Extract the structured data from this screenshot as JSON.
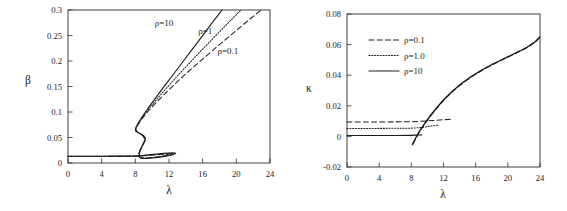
{
  "figure": {
    "title": "",
    "panel_count": 2
  },
  "chart_data": [
    {
      "type": "line",
      "panel": "left",
      "title": "",
      "xlabel": "λ",
      "ylabel": "β",
      "xlim": [
        0,
        24
      ],
      "ylim": [
        0,
        0.3
      ],
      "xticks": [
        0,
        4,
        8,
        12,
        16,
        20,
        24
      ],
      "xtick_labels": [
        "0",
        "4",
        "8",
        "12",
        "16",
        "20",
        "24"
      ],
      "yticks": [
        0,
        0.05,
        0.1,
        0.15,
        0.2,
        0.25,
        0.3
      ],
      "ytick_labels": [
        "0",
        "0.05",
        "0.1",
        "0.15",
        "0.2",
        "0.25",
        "0.3"
      ],
      "grid": false,
      "legend": "none",
      "annotations": [
        {
          "text": "ρ=10",
          "x": 11.4,
          "y": 0.268
        },
        {
          "text": "ρ=1",
          "x": 16.3,
          "y": 0.252
        },
        {
          "text": "ρ=0.1",
          "x": 19.0,
          "y": 0.214
        }
      ],
      "series": [
        {
          "name": "ρ=10",
          "style": "solid",
          "points": [
            [
              0.0,
              0.0132
            ],
            [
              2.0,
              0.0132
            ],
            [
              4.0,
              0.0133
            ],
            [
              6.0,
              0.0134
            ],
            [
              7.2,
              0.0136
            ],
            [
              8.2,
              0.0141
            ],
            [
              9.0,
              0.015
            ],
            [
              9.8,
              0.0163
            ],
            [
              10.6,
              0.0177
            ],
            [
              11.4,
              0.0189
            ],
            [
              12.0,
              0.0196
            ],
            [
              12.45,
              0.0199
            ],
            [
              12.7,
              0.0197
            ],
            [
              12.78,
              0.019
            ],
            [
              12.6,
              0.0172
            ],
            [
              12.1,
              0.0148
            ],
            [
              11.3,
              0.0124
            ],
            [
              10.4,
              0.0105
            ],
            [
              9.6,
              0.0094
            ],
            [
              9.05,
              0.0092
            ],
            [
              8.72,
              0.01
            ],
            [
              8.55,
              0.0118
            ],
            [
              8.48,
              0.0148
            ],
            [
              8.5,
              0.0196
            ],
            [
              8.62,
              0.0262
            ],
            [
              8.85,
              0.034
            ],
            [
              9.08,
              0.0408
            ],
            [
              9.2,
              0.0456
            ],
            [
              9.16,
              0.05
            ],
            [
              8.95,
              0.054
            ],
            [
              8.6,
              0.0575
            ],
            [
              8.25,
              0.0603
            ],
            [
              8.05,
              0.0626
            ],
            [
              8.0,
              0.0655
            ],
            [
              8.08,
              0.07
            ],
            [
              8.32,
              0.0775
            ],
            [
              8.7,
              0.0875
            ],
            [
              9.2,
              0.1
            ],
            [
              9.9,
              0.116
            ],
            [
              10.7,
              0.134
            ],
            [
              11.6,
              0.154
            ],
            [
              12.6,
              0.1755
            ],
            [
              13.6,
              0.1975
            ],
            [
              14.6,
              0.2195
            ],
            [
              15.5,
              0.239
            ],
            [
              16.4,
              0.259
            ],
            [
              17.2,
              0.2765
            ],
            [
              17.9,
              0.2915
            ],
            [
              18.3,
              0.3
            ]
          ]
        },
        {
          "name": "ρ=1",
          "style": "dotted",
          "points": [
            [
              0.0,
              0.013
            ],
            [
              2.0,
              0.013
            ],
            [
              4.0,
              0.0131
            ],
            [
              6.0,
              0.0132
            ],
            [
              7.4,
              0.0134
            ],
            [
              8.4,
              0.0139
            ],
            [
              9.2,
              0.0148
            ],
            [
              10.0,
              0.016
            ],
            [
              10.8,
              0.0172
            ],
            [
              11.5,
              0.0181
            ],
            [
              12.0,
              0.0186
            ],
            [
              12.3,
              0.0187
            ],
            [
              12.45,
              0.0184
            ],
            [
              12.4,
              0.0176
            ],
            [
              12.0,
              0.0158
            ],
            [
              11.3,
              0.0135
            ],
            [
              10.5,
              0.0114
            ],
            [
              9.7,
              0.01
            ],
            [
              9.1,
              0.0093
            ],
            [
              8.7,
              0.0095
            ],
            [
              8.5,
              0.0107
            ],
            [
              8.4,
              0.0132
            ],
            [
              8.4,
              0.0172
            ],
            [
              8.5,
              0.023
            ],
            [
              8.7,
              0.0305
            ],
            [
              8.95,
              0.0382
            ],
            [
              9.1,
              0.044
            ],
            [
              9.1,
              0.049
            ],
            [
              8.9,
              0.0535
            ],
            [
              8.6,
              0.057
            ],
            [
              8.3,
              0.06
            ],
            [
              8.1,
              0.0628
            ],
            [
              8.03,
              0.0658
            ],
            [
              8.12,
              0.0705
            ],
            [
              8.4,
              0.079
            ],
            [
              8.85,
              0.09
            ],
            [
              9.5,
              0.104
            ],
            [
              10.3,
              0.12
            ],
            [
              11.2,
              0.1375
            ],
            [
              12.2,
              0.156
            ],
            [
              13.3,
              0.176
            ],
            [
              14.4,
              0.1955
            ],
            [
              15.6,
              0.2165
            ],
            [
              16.8,
              0.237
            ],
            [
              18.0,
              0.2575
            ],
            [
              19.2,
              0.2775
            ],
            [
              20.3,
              0.296
            ],
            [
              20.55,
              0.3
            ]
          ]
        },
        {
          "name": "ρ=0.1",
          "style": "dashed",
          "points": [
            [
              0.0,
              0.0128
            ],
            [
              2.0,
              0.0128
            ],
            [
              4.0,
              0.0129
            ],
            [
              6.0,
              0.013
            ],
            [
              7.6,
              0.0133
            ],
            [
              8.6,
              0.0138
            ],
            [
              9.4,
              0.0146
            ],
            [
              10.2,
              0.0157
            ],
            [
              11.0,
              0.0167
            ],
            [
              11.6,
              0.0174
            ],
            [
              12.0,
              0.0177
            ],
            [
              12.2,
              0.0177
            ],
            [
              12.25,
              0.0173
            ],
            [
              12.0,
              0.0162
            ],
            [
              11.5,
              0.0144
            ],
            [
              10.8,
              0.0123
            ],
            [
              10.0,
              0.0107
            ],
            [
              9.3,
              0.0097
            ],
            [
              8.85,
              0.0095
            ],
            [
              8.6,
              0.0102
            ],
            [
              8.45,
              0.012
            ],
            [
              8.4,
              0.015
            ],
            [
              8.45,
              0.02
            ],
            [
              8.6,
              0.027
            ],
            [
              8.85,
              0.035
            ],
            [
              9.05,
              0.042
            ],
            [
              9.1,
              0.047
            ],
            [
              9.0,
              0.0515
            ],
            [
              8.75,
              0.0555
            ],
            [
              8.45,
              0.0588
            ],
            [
              8.2,
              0.0615
            ],
            [
              8.07,
              0.0645
            ],
            [
              8.1,
              0.068
            ],
            [
              8.35,
              0.076
            ],
            [
              8.8,
              0.087
            ],
            [
              9.5,
              0.101
            ],
            [
              10.4,
              0.117
            ],
            [
              11.4,
              0.134
            ],
            [
              12.5,
              0.152
            ],
            [
              13.7,
              0.1705
            ],
            [
              15.0,
              0.1895
            ],
            [
              16.3,
              0.208
            ],
            [
              17.7,
              0.228
            ],
            [
              19.1,
              0.2475
            ],
            [
              20.4,
              0.2655
            ],
            [
              21.6,
              0.282
            ],
            [
              22.6,
              0.2955
            ],
            [
              22.95,
              0.3
            ]
          ]
        }
      ]
    },
    {
      "type": "line",
      "panel": "right",
      "title": "",
      "xlabel": "λ",
      "ylabel": "κ",
      "xlim": [
        0,
        24
      ],
      "ylim": [
        -0.02,
        0.08
      ],
      "xticks": [
        0,
        4,
        8,
        12,
        16,
        20,
        24
      ],
      "xtick_labels": [
        "0",
        "4",
        "8",
        "12",
        "16",
        "20",
        "24"
      ],
      "yticks": [
        -0.02,
        0,
        0.02,
        0.04,
        0.06,
        0.08
      ],
      "ytick_labels": [
        "-0.02",
        "0",
        "0.02",
        "0.04",
        "0.06",
        "0.08"
      ],
      "grid": false,
      "legend": "upper-left",
      "legend_entries": [
        {
          "label": "ρ=0.1",
          "style": "dashed"
        },
        {
          "label": "ρ=1.0",
          "style": "dotted"
        },
        {
          "label": "ρ=10",
          "style": "solid"
        }
      ],
      "annotations": [],
      "series": [
        {
          "name": "ρ=0.1",
          "style": "dashed",
          "branches": [
            [
              [
                0.0,
                0.0094
              ],
              [
                3.0,
                0.0094
              ],
              [
                6.0,
                0.0095
              ],
              [
                8.0,
                0.0096
              ],
              [
                9.0,
                0.0098
              ],
              [
                10.0,
                0.0101
              ],
              [
                11.0,
                0.0105
              ],
              [
                12.0,
                0.0109
              ],
              [
                12.6,
                0.0111
              ],
              [
                13.0,
                0.0112
              ]
            ],
            [
              [
                8.2,
                -0.005
              ],
              [
                8.5,
                -0.002
              ],
              [
                8.8,
                0.001
              ],
              [
                9.2,
                0.0045
              ],
              [
                9.8,
                0.009
              ],
              [
                10.5,
                0.014
              ],
              [
                11.3,
                0.0192
              ],
              [
                12.2,
                0.0245
              ],
              [
                13.2,
                0.0296
              ],
              [
                14.3,
                0.0344
              ],
              [
                15.5,
                0.039
              ],
              [
                16.8,
                0.0432
              ],
              [
                18.2,
                0.0472
              ],
              [
                19.6,
                0.0508
              ],
              [
                21.0,
                0.0543
              ],
              [
                22.4,
                0.058
              ],
              [
                23.4,
                0.0615
              ],
              [
                24.0,
                0.065
              ]
            ]
          ]
        },
        {
          "name": "ρ=1.0",
          "style": "dotted",
          "branches": [
            [
              [
                0.0,
                0.0052
              ],
              [
                3.0,
                0.0052
              ],
              [
                6.0,
                0.0053
              ],
              [
                8.0,
                0.0054
              ],
              [
                9.0,
                0.0057
              ],
              [
                9.8,
                0.0062
              ],
              [
                10.5,
                0.0068
              ],
              [
                11.0,
                0.0072
              ],
              [
                11.4,
                0.0074
              ]
            ],
            [
              [
                8.15,
                -0.0052
              ],
              [
                8.45,
                -0.0022
              ],
              [
                8.75,
                0.0008
              ],
              [
                9.15,
                0.0044
              ],
              [
                9.75,
                0.009
              ],
              [
                10.45,
                0.014
              ],
              [
                11.25,
                0.0192
              ],
              [
                12.15,
                0.0246
              ],
              [
                13.15,
                0.0297
              ],
              [
                14.25,
                0.0345
              ],
              [
                15.45,
                0.0391
              ],
              [
                16.75,
                0.0433
              ],
              [
                18.15,
                0.0473
              ],
              [
                19.55,
                0.0509
              ],
              [
                20.95,
                0.0544
              ],
              [
                22.35,
                0.0581
              ],
              [
                23.35,
                0.0616
              ],
              [
                24.0,
                0.0651
              ]
            ]
          ]
        },
        {
          "name": "ρ=10",
          "style": "solid",
          "branches": [
            [
              [
                0.0,
                0.0006
              ],
              [
                3.0,
                0.0006
              ],
              [
                6.0,
                0.0006
              ],
              [
                8.0,
                0.0007
              ],
              [
                8.6,
                0.0008
              ],
              [
                9.0,
                0.0009
              ],
              [
                9.3,
                0.001
              ]
            ],
            [
              [
                8.1,
                -0.0055
              ],
              [
                8.4,
                -0.0024
              ],
              [
                8.7,
                0.0006
              ],
              [
                9.1,
                0.0042
              ],
              [
                9.7,
                0.0089
              ],
              [
                10.4,
                0.0139
              ],
              [
                11.2,
                0.0191
              ],
              [
                12.1,
                0.0245
              ],
              [
                13.1,
                0.0296
              ],
              [
                14.2,
                0.0344
              ],
              [
                15.4,
                0.039
              ],
              [
                16.7,
                0.0432
              ],
              [
                18.1,
                0.0472
              ],
              [
                19.5,
                0.0508
              ],
              [
                20.9,
                0.0543
              ],
              [
                22.3,
                0.058
              ],
              [
                23.3,
                0.0615
              ],
              [
                24.0,
                0.065
              ]
            ]
          ]
        }
      ]
    }
  ]
}
